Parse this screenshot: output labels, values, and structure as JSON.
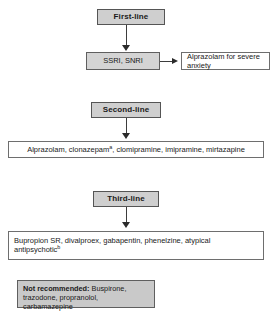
{
  "diagram": {
    "colors": {
      "header_fill": "#cfcfcf",
      "shaded_fill": "#d4d4d4",
      "plain_fill": "#ffffff",
      "note_fill": "#c9c9c9",
      "border": "#6b6b6b",
      "connector": "#3d3d3d",
      "text": "#1a1a1a"
    },
    "tiers": [
      {
        "id": "first-line",
        "header_label": "First-line",
        "treatment_label": "SSRI, SNRI",
        "branch_label": "Alprazolam for severe anxiety"
      },
      {
        "id": "second-line",
        "header_label": "Second-line",
        "treatment_label": "Alprazolam, clonazepam",
        "treatment_footnote": "a",
        "treatment_label_rest": ", clomipramine, imipramine, mirtazapine"
      },
      {
        "id": "third-line",
        "header_label": "Third-line",
        "treatment_label": "Bupropion SR, divalproex, gabapentin, phenelzine, atypical antipsychotic",
        "treatment_footnote": "b"
      }
    ],
    "not_recommended": {
      "label": "Not recommended:",
      "items": " Buspirone, trazodone, propranolol, carbamazepine"
    }
  }
}
